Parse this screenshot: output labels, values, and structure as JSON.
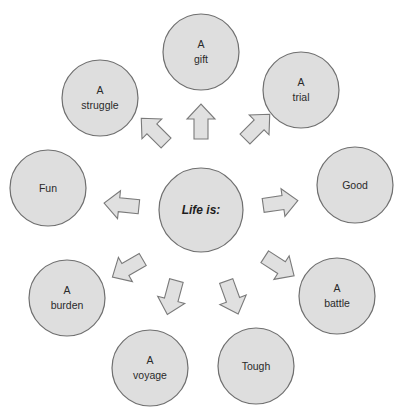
{
  "diagram": {
    "type": "radial concept map",
    "colors": {
      "node_fill": "#dedede",
      "node_stroke": "#6f6f6f",
      "arrow_fill": "#e0e0e0",
      "arrow_stroke": "#7a7a7a",
      "background": "#ffffff"
    },
    "center": {
      "label": "Life is:",
      "cx": 201,
      "cy": 210,
      "r": 42
    },
    "nodes": [
      {
        "id": "gift",
        "line1": "A",
        "line2": "gift",
        "cx": 201,
        "cy": 52,
        "r": 38
      },
      {
        "id": "trial",
        "line1": "A",
        "line2": "trial",
        "cx": 301,
        "cy": 90,
        "r": 38
      },
      {
        "id": "good",
        "line1": "",
        "line2": "Good",
        "cx": 355,
        "cy": 185,
        "r": 38
      },
      {
        "id": "battle",
        "line1": "A",
        "line2": "battle",
        "cx": 337,
        "cy": 296,
        "r": 38
      },
      {
        "id": "tough",
        "line1": "",
        "line2": "Tough",
        "cx": 256,
        "cy": 366,
        "r": 38
      },
      {
        "id": "voyage",
        "line1": "A",
        "line2": "voyage",
        "cx": 150,
        "cy": 368,
        "r": 38
      },
      {
        "id": "burden",
        "line1": "A",
        "line2": "burden",
        "cx": 67,
        "cy": 298,
        "r": 38
      },
      {
        "id": "fun",
        "line1": "",
        "line2": "Fun",
        "cx": 48,
        "cy": 188,
        "r": 38
      },
      {
        "id": "struggle",
        "line1": "A",
        "line2": "struggle",
        "cx": 100,
        "cy": 98,
        "r": 38
      }
    ],
    "arrows": [
      {
        "to": "gift",
        "cx": 201,
        "cy": 122,
        "angle": -90
      },
      {
        "to": "trial",
        "cx": 257,
        "cy": 127,
        "angle": -45
      },
      {
        "to": "good",
        "cx": 280,
        "cy": 203,
        "angle": -8
      },
      {
        "to": "battle",
        "cx": 279,
        "cy": 266,
        "angle": 33
      },
      {
        "to": "tough",
        "cx": 232,
        "cy": 297,
        "angle": 70
      },
      {
        "to": "voyage",
        "cx": 172,
        "cy": 297,
        "angle": 105
      },
      {
        "to": "burden",
        "cx": 128,
        "cy": 268,
        "angle": 150
      },
      {
        "to": "fun",
        "cx": 122,
        "cy": 205,
        "angle": 186
      },
      {
        "to": "struggle",
        "cx": 154,
        "cy": 131,
        "angle": 225
      }
    ]
  }
}
